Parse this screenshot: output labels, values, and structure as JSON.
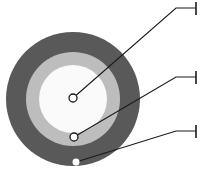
{
  "figure": {
    "type": "concentric-circle-callout-diagram",
    "width": 208,
    "height": 181,
    "background": "#ffffff"
  },
  "colors": {
    "outer_ring": "#595959",
    "middle_ring": "#bdbdbd",
    "inner_disc": "#fafafa",
    "leader_line": "#1a1a1a",
    "marker_fill": "#ffffff",
    "marker_stroke": "#1a1a1a"
  },
  "circles": {
    "center_x": 73,
    "center_y": 99,
    "outer_radius": 67,
    "middle_radius": 47,
    "inner_radius": 34,
    "layers": [
      {
        "name": "outer-ring",
        "radius": 67,
        "fill": "#595959"
      },
      {
        "name": "middle-ring",
        "radius": 47,
        "fill": "#bdbdbd"
      },
      {
        "name": "inner-disc",
        "radius": 34,
        "fill": "#fafafa"
      }
    ]
  },
  "callouts": [
    {
      "id": "callout-1",
      "target_layer": "inner-disc",
      "marker": {
        "x": 73,
        "y": 98,
        "style": "open-circle",
        "radius": 4
      },
      "elbow": {
        "x": 176,
        "y": 8
      },
      "end": {
        "x": 196,
        "y": 8
      },
      "tick": {
        "x": 196,
        "y_top": 2,
        "y_bottom": 15
      },
      "label": ""
    },
    {
      "id": "callout-2",
      "target_layer": "middle-ring",
      "marker": {
        "x": 74,
        "y": 137,
        "style": "open-circle",
        "radius": 4
      },
      "elbow": {
        "x": 176,
        "y": 77
      },
      "end": {
        "x": 196,
        "y": 77
      },
      "tick": {
        "x": 196,
        "y_top": 71,
        "y_bottom": 84
      },
      "label": ""
    },
    {
      "id": "callout-3",
      "target_layer": "outer-ring",
      "marker": {
        "x": 76,
        "y": 162,
        "style": "filled-dot",
        "radius": 3.5
      },
      "elbow": {
        "x": 176,
        "y": 131
      },
      "end": {
        "x": 196,
        "y": 131
      },
      "tick": {
        "x": 196,
        "y_top": 125,
        "y_bottom": 138
      },
      "label": ""
    }
  ]
}
